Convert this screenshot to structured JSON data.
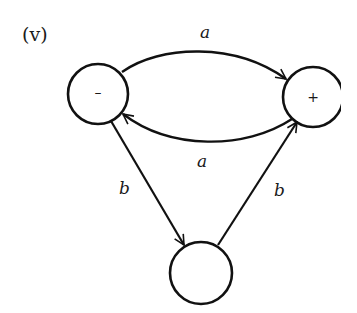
{
  "panel_label": "(v)",
  "nodes": [
    {
      "id": "minus",
      "label": "–",
      "cx": 98,
      "cy": 94,
      "r": 30
    },
    {
      "id": "plus",
      "label": "+",
      "cx": 313,
      "cy": 97,
      "r": 30
    },
    {
      "id": "bottom",
      "label": "",
      "cx": 201,
      "cy": 273,
      "r": 31
    }
  ],
  "edges": [
    {
      "from": "minus",
      "to": "plus",
      "label": "a",
      "shape": "arc-top"
    },
    {
      "from": "plus",
      "to": "minus",
      "label": "a",
      "shape": "arc-bottom"
    },
    {
      "from": "minus",
      "to": "bottom",
      "label": "b",
      "shape": "straight"
    },
    {
      "from": "bottom",
      "to": "plus",
      "label": "b",
      "shape": "straight"
    }
  ],
  "labels": {
    "edge_top_a": "a",
    "edge_bottom_a": "a",
    "edge_left_b": "b",
    "edge_right_b": "b",
    "node_minus": "–",
    "node_plus": "+"
  },
  "colors": {
    "stroke": "#111111",
    "background": "#ffffff"
  }
}
